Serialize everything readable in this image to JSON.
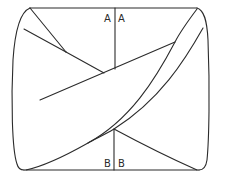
{
  "diagram": {
    "type": "pattern-piece-fold-diagram",
    "stroke_color": "#2b2b2b",
    "background": "#ffffff",
    "labels": {
      "top_left": "A",
      "top_right": "A",
      "bottom_left": "B",
      "bottom_right": "B"
    },
    "outline": {
      "top_edge": {
        "x1": 30,
        "y1": 8,
        "x2": 197,
        "y2": 8
      },
      "bottom_edge": {
        "x1": 22,
        "y1": 170,
        "x2": 200,
        "y2": 170
      }
    },
    "center_lines": {
      "top_vertical": {
        "x": 115,
        "y1": 8,
        "y2": 69
      },
      "bottom_vertical": {
        "x": 114,
        "y1": 129,
        "y2": 170
      }
    }
  }
}
